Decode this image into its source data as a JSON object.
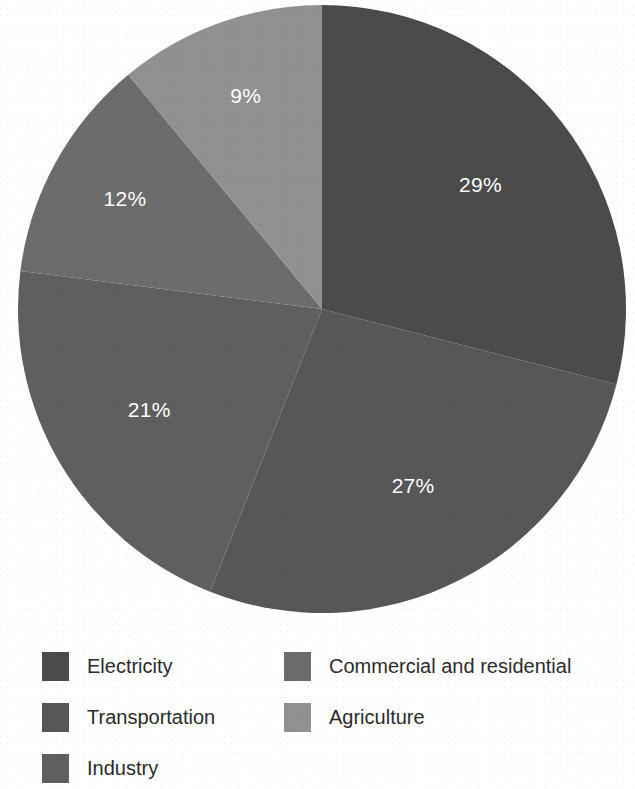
{
  "chart_data": {
    "type": "pie",
    "title": "",
    "subtitle": "",
    "xlabel": "",
    "ylabel": "",
    "legend_position": "bottom",
    "grid": false,
    "start_angle_deg": 0,
    "direction": "clockwise",
    "categories": [
      "Electricity",
      "Commercial and residential",
      "Industry",
      "Transportation",
      "Agriculture"
    ],
    "values": [
      29,
      27,
      21,
      12,
      9
    ],
    "value_unit": "%",
    "slices": [
      {
        "label": "Electricity",
        "value": 29,
        "display": "29%",
        "color": "#4b4b4b",
        "start_deg": 0.0,
        "end_deg": 104.4
      },
      {
        "label": "Commercial and residential",
        "value": 27,
        "display": "27%",
        "color": "#575757",
        "start_deg": 104.4,
        "end_deg": 201.6
      },
      {
        "label": "Industry",
        "value": 21,
        "display": "21%",
        "color": "#5f5f5f",
        "start_deg": 201.6,
        "end_deg": 277.2
      },
      {
        "label": "Transportation",
        "value": 12,
        "display": "12%",
        "color": "#6c6c6c",
        "start_deg": 277.2,
        "end_deg": 320.4
      },
      {
        "label": "Agriculture",
        "value": 9,
        "display": "9%",
        "color": "#919191",
        "start_deg": 320.4,
        "end_deg": 360.0
      }
    ]
  },
  "labels": {
    "electricity": "29%",
    "commercial": "27%",
    "industry": "21%",
    "transportation": "12%",
    "agriculture": "9%"
  },
  "legend": {
    "columns": [
      {
        "items": [
          {
            "label": "Electricity",
            "color": "#4b4b4b"
          },
          {
            "label": "Transportation",
            "color": "#575757"
          },
          {
            "label": "Industry",
            "color": "#5f5f5f"
          }
        ]
      },
      {
        "items": [
          {
            "label": "Commercial and residential",
            "color": "#6c6c6c"
          },
          {
            "label": "Agriculture",
            "color": "#919191"
          }
        ]
      }
    ]
  },
  "colors": {
    "background": "#ffffff",
    "text": "#2b2b2b",
    "label_text": "#ffffff"
  }
}
